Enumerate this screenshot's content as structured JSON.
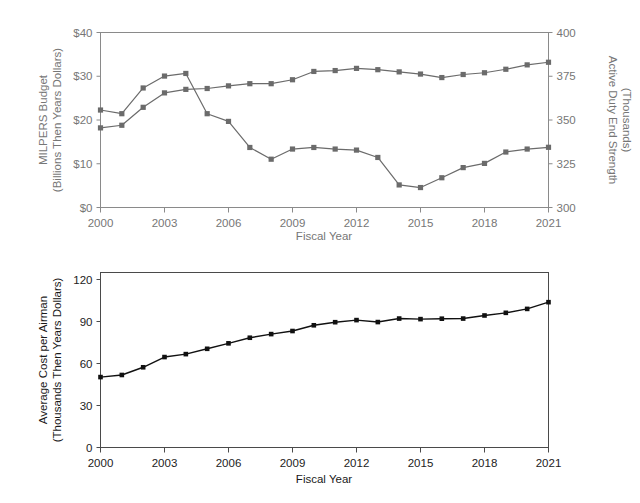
{
  "figure": {
    "background": "#ffffff",
    "width": 640,
    "height": 503
  },
  "chart_data": [
    {
      "id": "top",
      "type": "line",
      "title": "",
      "xlabel": "Fiscal Year",
      "ylabel": "MILPERS Budget\n(Billions Then Years Dollars)",
      "ylabel_line1": "MILPERS Budget",
      "ylabel_line2": "(Billions Then Years Dollars)",
      "y2label_line1": "Active Duty End Strength",
      "y2label_line2": "(Thousands)",
      "grid": false,
      "legend": "none",
      "xlim": [
        2000,
        2021
      ],
      "ylim": [
        0,
        40
      ],
      "y2lim": [
        300,
        400
      ],
      "xticks": [
        2000,
        2003,
        2006,
        2009,
        2012,
        2015,
        2018,
        2021
      ],
      "xticklabels": [
        "2000",
        "2003",
        "2006",
        "2009",
        "2012",
        "2015",
        "2018",
        "2021"
      ],
      "yticks": [
        0,
        10,
        20,
        30,
        40
      ],
      "yticklabels": [
        "$0",
        "$10",
        "$20",
        "$30",
        "$40"
      ],
      "y2ticks": [
        300,
        325,
        350,
        375,
        400
      ],
      "y2ticklabels": [
        "300",
        "325",
        "350",
        "375",
        "400"
      ],
      "x": [
        2000,
        2001,
        2002,
        2003,
        2004,
        2005,
        2006,
        2007,
        2008,
        2009,
        2010,
        2011,
        2012,
        2013,
        2014,
        2015,
        2016,
        2017,
        2018,
        2019,
        2020,
        2021
      ],
      "series": [
        {
          "name": "MILPERS Budget (Billions Then Years Dollars)",
          "axis": "left",
          "color": "#6b6b6b",
          "values": [
            18.2,
            18.8,
            22.9,
            26.2,
            27.0,
            27.2,
            27.8,
            28.3,
            28.3,
            29.2,
            31.1,
            31.3,
            31.8,
            31.5,
            31.0,
            30.5,
            29.7,
            30.4,
            30.8,
            31.6,
            32.6,
            33.2
          ]
        },
        {
          "name": "Active Duty End Strength (Thousands)",
          "axis": "right",
          "color": "#6b6b6b",
          "values": [
            355.7,
            353.6,
            368.3,
            375.1,
            376.6,
            353.6,
            349.2,
            334.3,
            327.6,
            333.4,
            334.3,
            333.4,
            332.8,
            328.6,
            312.9,
            311.4,
            317.0,
            322.8,
            325.2,
            331.7,
            333.4,
            334.4
          ]
        }
      ],
      "axis_color": "#8a8a8a",
      "text_color": "#767676"
    },
    {
      "id": "bottom",
      "type": "line",
      "title": "",
      "xlabel": "Fiscal Year",
      "ylabel_line1": "Average Cost per Airman",
      "ylabel_line2": "(Thousands Then Years Dollars)",
      "grid": false,
      "legend": "none",
      "xlim": [
        2000,
        2021
      ],
      "ylim": [
        0,
        125
      ],
      "xticks": [
        2000,
        2003,
        2006,
        2009,
        2012,
        2015,
        2018,
        2021
      ],
      "xticklabels": [
        "2000",
        "2003",
        "2006",
        "2009",
        "2012",
        "2015",
        "2018",
        "2021"
      ],
      "yticks": [
        0,
        30,
        60,
        90,
        120
      ],
      "yticklabels": [
        "0",
        "30",
        "60",
        "90",
        "120"
      ],
      "x": [
        2000,
        2001,
        2002,
        2003,
        2004,
        2005,
        2006,
        2007,
        2008,
        2009,
        2010,
        2011,
        2012,
        2013,
        2014,
        2015,
        2016,
        2017,
        2018,
        2019,
        2020,
        2021
      ],
      "series": [
        {
          "name": "Average Cost per Airman (Thousands Then Years Dollars)",
          "axis": "left",
          "color": "#111111",
          "values": [
            50.3,
            51.8,
            57.3,
            64.6,
            66.7,
            70.5,
            74.4,
            78.4,
            81.0,
            83.2,
            87.3,
            89.5,
            91.0,
            89.6,
            92.1,
            91.7,
            92.0,
            92.1,
            94.3,
            96.2,
            99.0,
            103.8
          ]
        }
      ],
      "axis_color": "#4a4a4a",
      "text_color": "#1a1a1a"
    }
  ]
}
